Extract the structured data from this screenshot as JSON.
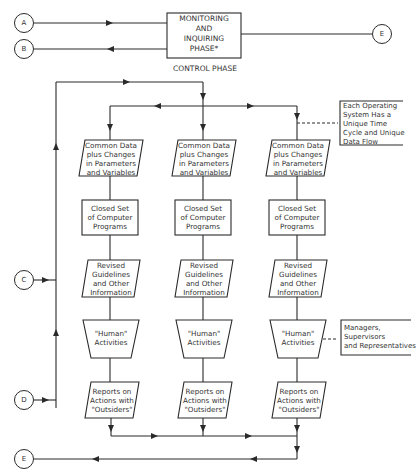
{
  "header": {
    "monitoring_box": "MONITORING\nAND\nINQUIRING\nPHASE*",
    "control_phase": "CONTROL PHASE"
  },
  "connectors": {
    "a": "A",
    "b": "B",
    "c": "C",
    "d": "D",
    "e_top": "E",
    "e_bottom": "E"
  },
  "columns": [
    {
      "data": "Common Data\nplus Changes\nin Parameters\nand Variables",
      "programs": "Closed Set\nof Computer\nPrograms",
      "guidelines": "Revised\nGuidelines\nand Other\nInformation",
      "human": "\"Human\"\nActivities",
      "reports": "Reports on\nActions with\n\"Outsiders\""
    },
    {
      "data": "Common Data\nplus Changes\nin Parameters\nand Variables",
      "programs": "Closed Set\nof Computer\nPrograms",
      "guidelines": "Revised\nGuidelines\nand Other\nInformation",
      "human": "\"Human\"\nActivities",
      "reports": "Reports on\nActions with\n\"Outsiders\""
    },
    {
      "data": "Common Data\nplus Changes\nin Parameters\nand Variables",
      "programs": "Closed Set\nof Computer\nPrograms",
      "guidelines": "Revised\nGuidelines\nand Other\nInformation",
      "human": "\"Human\"\nActivities",
      "reports": "Reports on\nActions with\n\"Outsiders\""
    }
  ],
  "notes": {
    "operating_system": "Each Operating\nSystem Has a\nUnique Time\nCycle and Unique\nData Flow",
    "managers": "Managers,\nSupervisors\nand Representatives"
  }
}
